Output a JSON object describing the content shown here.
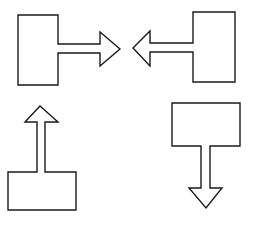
{
  "diagram": {
    "type": "block-arrow-shapes",
    "background": "#ffffff",
    "stroke_color": "#1a1a1a",
    "shapes": [
      {
        "name": "box-with-right-arrow",
        "direction": "right",
        "position": "top-left",
        "points": "18,15 58,15 58,44 100,44 100,32 120,49 100,66 100,53 58,53 58,85 18,85"
      },
      {
        "name": "box-with-left-arrow",
        "direction": "left",
        "position": "top-right",
        "points": "193,12 235,12 235,82 193,82 193,52 150,52 150,66 133,48 150,31 150,43 193,43"
      },
      {
        "name": "box-with-up-arrow",
        "direction": "up",
        "position": "bottom-left",
        "points": "8,172 37,172 37,122 25,122 40,106 58,122 45,122 45,172 76,172 76,210 8,210"
      },
      {
        "name": "box-with-down-arrow",
        "direction": "down",
        "position": "bottom-right",
        "points": "172,103 240,103 240,146 210,146 210,188 222,188 206,208 189,188 201,188 201,146 172,146"
      }
    ]
  }
}
